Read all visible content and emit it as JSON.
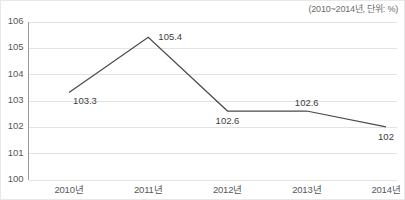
{
  "annotation": {
    "unit_note": "(2010~2014년, 단위: %)"
  },
  "chart_data": {
    "type": "line",
    "title": "",
    "subtitle": "",
    "xlabel": "",
    "ylabel": "",
    "categories": [
      "2010년",
      "2011년",
      "2012년",
      "2013년",
      "2014년"
    ],
    "values": [
      103.3,
      105.4,
      102.6,
      102.6,
      102
    ],
    "point_labels": [
      "103.3",
      "105.4",
      "102.6",
      "102.6",
      "102"
    ],
    "label_positions": [
      "below-right",
      "right",
      "below",
      "above",
      "below"
    ],
    "ylim": [
      100,
      106
    ],
    "y_ticks": [
      100,
      101,
      102,
      103,
      104,
      105,
      106
    ],
    "y_tick_labels": [
      "100",
      "101",
      "102",
      "103",
      "104",
      "105",
      "106"
    ],
    "grid": true,
    "grid_axis": "y",
    "legend": false,
    "legend_position": "none",
    "annotations": [
      "(2010~2014년, 단위: %)"
    ],
    "series_color": "#4a4a4a",
    "grid_color": "#e3e3e3",
    "axis_color": "#9a9a9a",
    "background_color": "#ffffff"
  }
}
